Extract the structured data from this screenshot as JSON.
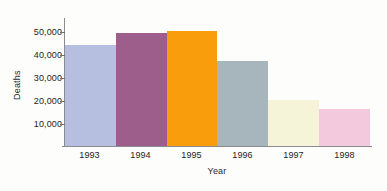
{
  "chart_data": {
    "type": "bar",
    "title": "",
    "subtitle": "",
    "xlabel": "Year",
    "ylabel": "Deaths",
    "categories": [
      "1993",
      "1994",
      "1995",
      "1996",
      "1997",
      "1998"
    ],
    "values": [
      44000,
      49500,
      50500,
      37000,
      20000,
      16000
    ],
    "ylim": [
      0,
      56000
    ],
    "yticks": [
      10000,
      20000,
      30000,
      40000,
      50000
    ],
    "ytick_labels": [
      "10,000",
      "20,000",
      "30,000",
      "40,000",
      "50,000"
    ],
    "grid": false,
    "legend": "none",
    "bar_colors": [
      "#b7bfe0",
      "#9d5e8c",
      "#f99d0d",
      "#a7b6bd",
      "#f5f4d9",
      "#f3c9dd"
    ],
    "axis_color": "#8b8b93",
    "text_color": "#242424",
    "background": "#fdfdfb",
    "bars": [
      {
        "category": "1993",
        "value": 44000,
        "color": "#b7bfe0"
      },
      {
        "category": "1994",
        "value": 49500,
        "color": "#9d5e8c"
      },
      {
        "category": "1995",
        "value": 50500,
        "color": "#f99d0d"
      },
      {
        "category": "1996",
        "value": 37000,
        "color": "#a7b6bd"
      },
      {
        "category": "1997",
        "value": 20000,
        "color": "#f5f4d9"
      },
      {
        "category": "1998",
        "value": 16000,
        "color": "#f3c9dd"
      }
    ]
  }
}
